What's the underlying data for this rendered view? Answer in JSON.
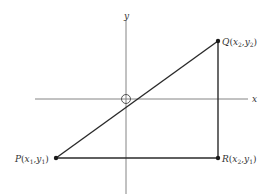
{
  "axes": {
    "x_label": "x",
    "y_label": "y",
    "origin_marker": "circle"
  },
  "points": {
    "P": {
      "name": "P",
      "open": "(",
      "x": "x",
      "xsub": "1",
      "sep": ",",
      "y": "y",
      "ysub": "1",
      "close": ")"
    },
    "Q": {
      "name": "Q",
      "open": "(",
      "x": "x",
      "xsub": "2",
      "sep": ",",
      "y": "y",
      "ysub": "2",
      "close": ")"
    },
    "R": {
      "name": "R",
      "open": "(",
      "x": "x",
      "xsub": "2",
      "sep": ",",
      "y": "y",
      "ysub": "1",
      "close": ")"
    }
  },
  "colors": {
    "line": "#2a2a2a",
    "axis": "#777777",
    "text": "#333333",
    "background": "#ffffff"
  }
}
